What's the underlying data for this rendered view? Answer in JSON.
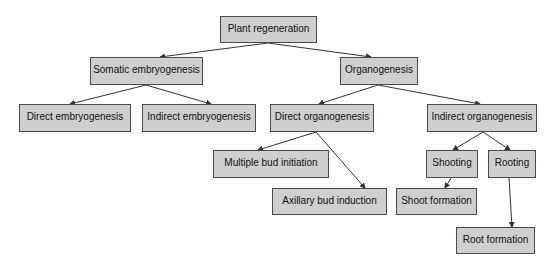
{
  "diagram": {
    "type": "tree",
    "colors": {
      "box_fill": "#cfcfcf",
      "box_border": "#4a4a4a",
      "edge": "#333333",
      "text": "#111111"
    },
    "nodes": [
      {
        "id": "root",
        "label": "Plant regeneration",
        "x": 220,
        "y": 16,
        "w": 97,
        "h": 27
      },
      {
        "id": "somatic",
        "label": "Somatic embryogenesis",
        "x": 90,
        "y": 57,
        "w": 113,
        "h": 28
      },
      {
        "id": "organo",
        "label": "Organogenesis",
        "x": 340,
        "y": 57,
        "w": 78,
        "h": 28
      },
      {
        "id": "direct_emb",
        "label": "Direct embryogenesis",
        "x": 19,
        "y": 104,
        "w": 112,
        "h": 28
      },
      {
        "id": "indirect_emb",
        "label": "Indirect embryogenesis",
        "x": 142,
        "y": 104,
        "w": 114,
        "h": 28
      },
      {
        "id": "direct_org",
        "label": "Direct organogenesis",
        "x": 270,
        "y": 104,
        "w": 104,
        "h": 28
      },
      {
        "id": "indirect_org",
        "label": "Indirect organogenesis",
        "x": 427,
        "y": 104,
        "w": 110,
        "h": 28
      },
      {
        "id": "multi_bud",
        "label": "Multiple bud initiation",
        "x": 213,
        "y": 150,
        "w": 116,
        "h": 28
      },
      {
        "id": "axillary",
        "label": "Axillary bud induction",
        "x": 272,
        "y": 188,
        "w": 115,
        "h": 27
      },
      {
        "id": "shooting",
        "label": "Shooting",
        "x": 426,
        "y": 150,
        "w": 52,
        "h": 28
      },
      {
        "id": "rooting",
        "label": "Rooting",
        "x": 488,
        "y": 150,
        "w": 48,
        "h": 28
      },
      {
        "id": "shoot_form",
        "label": "Shoot formation",
        "x": 396,
        "y": 188,
        "w": 81,
        "h": 27
      },
      {
        "id": "root_form",
        "label": "Root formation",
        "x": 456,
        "y": 227,
        "w": 79,
        "h": 27
      }
    ],
    "edges": [
      {
        "from": "root",
        "to": "somatic",
        "x1": 268,
        "y1": 43,
        "x2": 160,
        "y2": 57
      },
      {
        "from": "root",
        "to": "organo",
        "x1": 268,
        "y1": 43,
        "x2": 371,
        "y2": 57
      },
      {
        "from": "somatic",
        "to": "direct_emb",
        "x1": 146,
        "y1": 85,
        "x2": 70,
        "y2": 104
      },
      {
        "from": "somatic",
        "to": "indirect_emb",
        "x1": 146,
        "y1": 85,
        "x2": 211,
        "y2": 104
      },
      {
        "from": "organo",
        "to": "direct_org",
        "x1": 378,
        "y1": 85,
        "x2": 319,
        "y2": 104
      },
      {
        "from": "organo",
        "to": "indirect_org",
        "x1": 378,
        "y1": 85,
        "x2": 480,
        "y2": 104
      },
      {
        "from": "direct_org",
        "to": "multi_bud",
        "x1": 316,
        "y1": 132,
        "x2": 258,
        "y2": 150
      },
      {
        "from": "direct_org",
        "to": "axillary",
        "x1": 316,
        "y1": 132,
        "x2": 365,
        "y2": 188
      },
      {
        "from": "indirect_org",
        "to": "shooting",
        "x1": 483,
        "y1": 132,
        "x2": 453,
        "y2": 150
      },
      {
        "from": "indirect_org",
        "to": "rooting",
        "x1": 483,
        "y1": 132,
        "x2": 510,
        "y2": 150
      },
      {
        "from": "shooting",
        "to": "shoot_form",
        "x1": 451,
        "y1": 178,
        "x2": 445,
        "y2": 188
      },
      {
        "from": "rooting",
        "to": "root_form",
        "x1": 509,
        "y1": 178,
        "x2": 512,
        "y2": 227
      }
    ]
  }
}
